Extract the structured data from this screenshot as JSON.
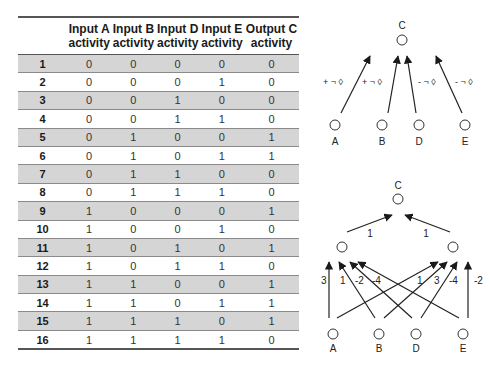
{
  "table": {
    "headers": [
      "",
      "Input A\nactivity",
      "Input B\nactivity",
      "Input D\nactivity",
      "Input E\nactivity",
      "Output C\nactivity"
    ],
    "header_lines": [
      [
        "",
        ""
      ],
      [
        "Input A",
        "activity"
      ],
      [
        "Input B",
        "activity"
      ],
      [
        "Input D",
        "activity"
      ],
      [
        "Input E",
        "activity"
      ],
      [
        "Output C",
        "activity"
      ]
    ],
    "rows": [
      {
        "n": "1",
        "a": "0",
        "b": "0",
        "d": "0",
        "e": "0",
        "c": "0"
      },
      {
        "n": "2",
        "a": "0",
        "b": "0",
        "d": "0",
        "e": "1",
        "c": "0"
      },
      {
        "n": "3",
        "a": "0",
        "b": "0",
        "d": "1",
        "e": "0",
        "c": "0"
      },
      {
        "n": "4",
        "a": "0",
        "b": "0",
        "d": "1",
        "e": "1",
        "c": "0"
      },
      {
        "n": "5",
        "a": "0",
        "b": "1",
        "d": "0",
        "e": "0",
        "c": "1"
      },
      {
        "n": "6",
        "a": "0",
        "b": "1",
        "d": "0",
        "e": "1",
        "c": "1"
      },
      {
        "n": "7",
        "a": "0",
        "b": "1",
        "d": "1",
        "e": "0",
        "c": "0"
      },
      {
        "n": "8",
        "a": "0",
        "b": "1",
        "d": "1",
        "e": "1",
        "c": "0"
      },
      {
        "n": "9",
        "a": "1",
        "b": "0",
        "d": "0",
        "e": "0",
        "c": "1"
      },
      {
        "n": "10",
        "a": "1",
        "b": "0",
        "d": "0",
        "e": "1",
        "c": "0"
      },
      {
        "n": "11",
        "a": "1",
        "b": "0",
        "d": "1",
        "e": "0",
        "c": "1"
      },
      {
        "n": "12",
        "a": "1",
        "b": "0",
        "d": "1",
        "e": "1",
        "c": "0"
      },
      {
        "n": "13",
        "a": "1",
        "b": "1",
        "d": "0",
        "e": "0",
        "c": "1"
      },
      {
        "n": "14",
        "a": "1",
        "b": "1",
        "d": "0",
        "e": "1",
        "c": "1"
      },
      {
        "n": "15",
        "a": "1",
        "b": "1",
        "d": "1",
        "e": "0",
        "c": "1"
      },
      {
        "n": "16",
        "a": "1",
        "b": "1",
        "d": "1",
        "e": "1",
        "c": "0"
      }
    ],
    "shade_color": "#d5d5d5"
  },
  "top_diagram": {
    "output_label": "C",
    "input_labels": [
      "A",
      "B",
      "D",
      "E"
    ],
    "edge_labels": [
      "+ ¬ ◊",
      "+ ¬ ◊",
      "- ¬ ◊",
      "- ¬ ◊"
    ]
  },
  "bottom_diagram": {
    "output_label": "C",
    "input_labels": [
      "A",
      "B",
      "D",
      "E"
    ],
    "hidden_to_output_weights": [
      "1",
      "1"
    ],
    "left_hidden_weights": [
      "3",
      "1",
      "-2",
      "-4"
    ],
    "right_hidden_weights": [
      "1",
      "3",
      "-4",
      "-2"
    ]
  }
}
